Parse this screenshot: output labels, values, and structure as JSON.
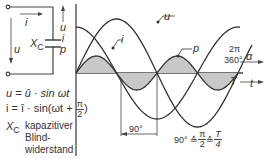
{
  "circuit": {
    "current_label": "i",
    "voltage_label": "u",
    "capacitor_label": "X",
    "capacitor_sub": "C"
  },
  "formulas": {
    "u_line": "u = û · sin ωt",
    "i_line_prefix": "i  =  î · sin(ωt + ",
    "i_frac_num": "π",
    "i_frac_den": "2",
    "i_line_suffix": ")",
    "xc_symbol": "X",
    "xc_sub": "C",
    "xc_desc_1": "kapazitiver",
    "xc_desc_2": "Blind-",
    "xc_desc_3": "widerstand"
  },
  "chart": {
    "y_axis_labels": [
      "u",
      "i",
      "p"
    ],
    "curve_labels": {
      "u": "u",
      "i": "i",
      "p": "p"
    },
    "x_axis_angle_top": "2π",
    "x_axis_angle_bottom": "360°",
    "x_axis_angle_var": "α",
    "x_axis_time_period": "T",
    "x_axis_time_var": "t",
    "phase_dimension": "90°",
    "equivalence_prefix": "90° ≙ ",
    "eq_frac1_num": "π",
    "eq_frac1_den": "2",
    "eq_mid": " ≙ ",
    "eq_frac2_num": "T",
    "eq_frac2_den": "4",
    "colors": {
      "line": "#333333",
      "fill": "#c8c8c8",
      "axis": "#444444"
    }
  },
  "chart_data": {
    "type": "line",
    "title": "",
    "xlabel": "α / t",
    "ylabel": "u, i, p",
    "x_ticks": [
      "0",
      "90°",
      "180°",
      "270°",
      "360° (2π, T)"
    ],
    "series": [
      {
        "name": "u",
        "expr": "û·sin(ωt)",
        "relative_amplitude": 1.0,
        "phase_deg": 0
      },
      {
        "name": "i",
        "expr": "î·sin(ωt+π/2)",
        "relative_amplitude": 0.85,
        "phase_deg": 90
      },
      {
        "name": "p",
        "expr": "u·i",
        "relative_amplitude": 0.32,
        "frequency_multiple": 2,
        "shaded": true
      }
    ],
    "annotations": [
      "90° phase shift between i and u",
      "90° ≙ π/2 ≙ T/4"
    ]
  }
}
